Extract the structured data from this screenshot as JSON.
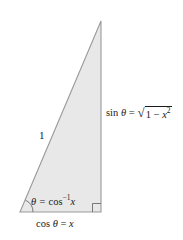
{
  "figure": {
    "type": "geometry-diagram",
    "background_color": "#ffffff",
    "triangle": {
      "fill_color": "#e8e8e8",
      "stroke_color": "#9a9a9a",
      "vertices": {
        "apex": [
          101,
          21
        ],
        "bottom_right": [
          101,
          212
        ],
        "bottom_left": [
          20,
          212
        ]
      },
      "right_angle_marker": {
        "at": "bottom_right",
        "size": 8
      },
      "angle_arc": {
        "at": "bottom_left",
        "radius": 13,
        "label": "theta"
      }
    },
    "labels": {
      "hypotenuse": "1",
      "angle_prefix": "θ = ",
      "angle_function": "cos",
      "angle_exponent": "−1",
      "angle_argument": "x",
      "base_prefix": "cos ",
      "base_theta": "θ",
      "base_equals": " = ",
      "base_value": "x",
      "opposite_prefix": "sin ",
      "opposite_theta": "θ",
      "opposite_equals": " = ",
      "radical_symbol": "√",
      "radicand_one": "1 − ",
      "radicand_x": "x",
      "radicand_exponent": "2"
    }
  }
}
